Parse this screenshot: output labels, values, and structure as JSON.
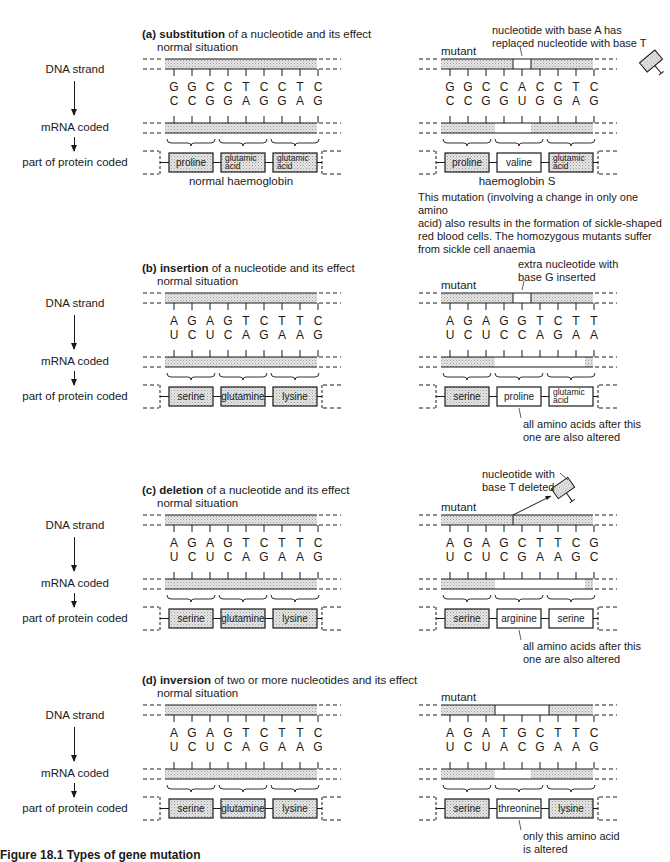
{
  "colors": {
    "ink": "#1a1a1a",
    "hatch": "#d9d9d9",
    "background": "#ffffff"
  },
  "row_labels": {
    "dna": "DNA strand",
    "mrna": "mRNA coded",
    "protein": "part of protein coded"
  },
  "sections": [
    {
      "id": "a",
      "letter": "(a)",
      "keyword": "substitution",
      "title_rest": " of a nucleotide and its effect",
      "subtitle": "normal situation",
      "top": 28,
      "normal": {
        "dna": [
          "G",
          "G",
          "C",
          "C",
          "T",
          "C",
          "C",
          "T",
          "C"
        ],
        "mrna": [
          "C",
          "C",
          "G",
          "G",
          "A",
          "G",
          "G",
          "A",
          "G"
        ],
        "proteins": [
          {
            "label": "proline",
            "hatched": true
          },
          {
            "label": "glutamic acid",
            "hatched": true
          },
          {
            "label": "glutamic acid",
            "hatched": true
          }
        ],
        "caption": "normal haemoglobin"
      },
      "mutant": {
        "label": "mutant",
        "dna": [
          "G",
          "G",
          "C",
          "C",
          "A",
          "C",
          "C",
          "T",
          "C"
        ],
        "mrna": [
          "C",
          "C",
          "G",
          "G",
          "U",
          "G",
          "G",
          "A",
          "G"
        ],
        "dna_gap": [
          4,
          4
        ],
        "mrna_plain": [
          3,
          5
        ],
        "proteins": [
          {
            "label": "proline",
            "hatched": true
          },
          {
            "label": "valine",
            "hatched": false
          },
          {
            "label": "glutamic acid",
            "hatched": true
          }
        ],
        "caption": "haemoglobin S",
        "annotation": "nucleotide with base A has replaced nucleotide with base T",
        "annotation_lines": [
          "nucleotide with base A has",
          "replaced nucleotide with base T"
        ],
        "floating_nucleotide": true
      },
      "footnote_lines": [
        "This mutation (involving a change in only one amino",
        "acid) also results in the formation of sickle-shaped",
        "red blood cells. The homozygous mutants suffer",
        "from sickle cell anaemia"
      ]
    },
    {
      "id": "b",
      "letter": "(b)",
      "keyword": "insertion",
      "title_rest": " of a nucleotide and its effect",
      "subtitle": "normal situation",
      "top": 262,
      "normal": {
        "dna": [
          "A",
          "G",
          "A",
          "G",
          "T",
          "C",
          "T",
          "T",
          "C"
        ],
        "mrna": [
          "U",
          "C",
          "U",
          "C",
          "A",
          "G",
          "A",
          "A",
          "G"
        ],
        "proteins": [
          {
            "label": "serine",
            "hatched": true
          },
          {
            "label": "glutamine",
            "hatched": true
          },
          {
            "label": "lysine",
            "hatched": true
          }
        ]
      },
      "mutant": {
        "label": "mutant",
        "dna": [
          "A",
          "G",
          "A",
          "G",
          "G",
          "T",
          "C",
          "T",
          "T"
        ],
        "mrna": [
          "U",
          "C",
          "U",
          "C",
          "C",
          "A",
          "G",
          "A",
          "A"
        ],
        "dna_gap": [
          4,
          4
        ],
        "mrna_plain": [
          3,
          8
        ],
        "proteins": [
          {
            "label": "serine",
            "hatched": true
          },
          {
            "label": "proline",
            "hatched": false
          },
          {
            "label": "glutamic acid",
            "hatched": false
          }
        ],
        "annotation_lines": [
          "extra nucleotide with",
          "base G inserted"
        ],
        "result_lines": [
          "all amino acids after this",
          "one are also altered"
        ]
      }
    },
    {
      "id": "c",
      "letter": "(c)",
      "keyword": "deletion",
      "title_rest": " of a nucleotide and its effect",
      "subtitle": "normal situation",
      "top": 484,
      "normal": {
        "dna": [
          "A",
          "G",
          "A",
          "G",
          "T",
          "C",
          "T",
          "T",
          "C"
        ],
        "mrna": [
          "U",
          "C",
          "U",
          "C",
          "A",
          "G",
          "A",
          "A",
          "G"
        ],
        "proteins": [
          {
            "label": "serine",
            "hatched": true
          },
          {
            "label": "glutamine",
            "hatched": true
          },
          {
            "label": "lysine",
            "hatched": true
          }
        ]
      },
      "mutant": {
        "label": "mutant",
        "dna": [
          "A",
          "G",
          "A",
          "G",
          "C",
          "T",
          "T",
          "C",
          "G"
        ],
        "mrna": [
          "U",
          "C",
          "U",
          "C",
          "G",
          "A",
          "A",
          "G",
          "C"
        ],
        "dna_gap": null,
        "mrna_plain": [
          3,
          8
        ],
        "proteins": [
          {
            "label": "serine",
            "hatched": true
          },
          {
            "label": "arginine",
            "hatched": false
          },
          {
            "label": "serine",
            "hatched": false
          }
        ],
        "annotation_lines": [
          "nucleotide with",
          "base T deleted"
        ],
        "result_lines": [
          "all amino acids after this",
          "one are also altered"
        ],
        "floating_nucleotide": true
      }
    },
    {
      "id": "d",
      "letter": "(d)",
      "keyword": "inversion",
      "title_rest": " of two or more nucleotides and its effect",
      "subtitle": "normal situation",
      "top": 674,
      "normal": {
        "dna": [
          "A",
          "G",
          "A",
          "G",
          "T",
          "C",
          "T",
          "T",
          "C"
        ],
        "mrna": [
          "U",
          "C",
          "U",
          "C",
          "A",
          "G",
          "A",
          "A",
          "G"
        ],
        "proteins": [
          {
            "label": "serine",
            "hatched": true
          },
          {
            "label": "glutamine",
            "hatched": true
          },
          {
            "label": "lysine",
            "hatched": true
          }
        ]
      },
      "mutant": {
        "label": "mutant",
        "dna": [
          "A",
          "G",
          "A",
          "T",
          "G",
          "C",
          "T",
          "T",
          "C"
        ],
        "mrna": [
          "U",
          "C",
          "U",
          "A",
          "C",
          "G",
          "A",
          "A",
          "G"
        ],
        "dna_gap": [
          3,
          5
        ],
        "mrna_plain": [
          3,
          5
        ],
        "proteins": [
          {
            "label": "serine",
            "hatched": true
          },
          {
            "label": "threonine",
            "hatched": false
          },
          {
            "label": "lysine",
            "hatched": true
          }
        ],
        "result_lines": [
          "only this amino acid",
          "is altered"
        ]
      }
    }
  ],
  "figure_caption_partial": "Figure 18.1 Types of gene mutation"
}
